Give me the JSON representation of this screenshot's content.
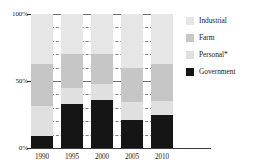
{
  "chart_data": {
    "type": "bar",
    "subtype": "stacked-bar-100-percent",
    "title": "",
    "xlabel": "",
    "ylabel": "",
    "categories": [
      "1990",
      "1995",
      "2000",
      "2005",
      "2010"
    ],
    "ylim": [
      0,
      100
    ],
    "y_ticks": [
      "0%",
      "50%",
      "100%"
    ],
    "y_tick_values": [
      0,
      50,
      100
    ],
    "gridlines": true,
    "grid_minor_count": 10,
    "legend_position": "right",
    "stack_order_bottom_to_top": [
      "Government",
      "Personal*",
      "Farm",
      "Industrial"
    ],
    "series": [
      {
        "name": "Government",
        "color": "#151515",
        "values": [
          9,
          33,
          36,
          21,
          25
        ]
      },
      {
        "name": "Personal*",
        "color": "#e0e0e0",
        "values": [
          22,
          12,
          12,
          13,
          10
        ]
      },
      {
        "name": "Farm",
        "color": "#c6c6c6",
        "values": [
          32,
          25,
          22,
          26,
          28
        ]
      },
      {
        "name": "Industrial",
        "color": "#e6e6e6",
        "values": [
          37,
          30,
          30,
          40,
          37
        ]
      }
    ]
  },
  "legend": {
    "items": [
      {
        "label": "Industrial",
        "color": "#e6e6e6"
      },
      {
        "label": "Farm",
        "color": "#c6c6c6"
      },
      {
        "label": "Personal*",
        "color": "#e0e0e0"
      },
      {
        "label": "Government",
        "color": "#151515"
      }
    ]
  },
  "axes": {
    "y_labels": [
      "100%",
      "50%",
      "0%"
    ],
    "x_labels": [
      "1990",
      "1995",
      "2000",
      "2005",
      "2010"
    ]
  }
}
